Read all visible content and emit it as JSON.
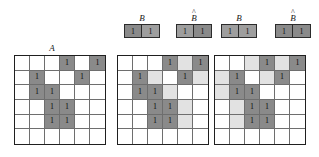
{
  "figure": {
    "caption_labels": {
      "set_a": "A",
      "b": "B",
      "b_hat": "B",
      "hat_glyph": "^"
    }
  },
  "structuring_elements": [
    {
      "id": "se-group-1",
      "name": "dilation-structuring-elements",
      "elements": [
        {
          "label": "B",
          "hat": false,
          "cells": [
            {
              "value": "1",
              "shade": "dark"
            },
            {
              "value": "1",
              "shade": "dark"
            }
          ]
        },
        {
          "label": "B",
          "hat": true,
          "cells": [
            {
              "value": "1",
              "shade": "dark"
            },
            {
              "value": "1",
              "shade": "dark"
            }
          ]
        }
      ]
    },
    {
      "id": "se-group-2",
      "name": "erosion-structuring-elements",
      "elements": [
        {
          "label": "B",
          "hat": false,
          "cells": [
            {
              "value": "1",
              "shade": "dark"
            },
            {
              "value": "1",
              "shade": "dark"
            }
          ]
        },
        {
          "label": "B",
          "hat": true,
          "cells": [
            {
              "value": "1",
              "shade": "dark"
            },
            {
              "value": "1",
              "shade": "dark"
            }
          ]
        }
      ]
    }
  ],
  "grids": [
    {
      "id": "grid-a",
      "title": "A",
      "rows": 6,
      "cols": 6,
      "cells": [
        [
          "empty",
          "empty",
          "empty",
          "dark",
          "empty",
          "dark"
        ],
        [
          "empty",
          "dark",
          "empty",
          "empty",
          "dark",
          "empty"
        ],
        [
          "empty",
          "dark",
          "dark",
          "empty",
          "empty",
          "empty"
        ],
        [
          "empty",
          "empty",
          "dark",
          "dark",
          "empty",
          "empty"
        ],
        [
          "empty",
          "empty",
          "dark",
          "dark",
          "empty",
          "empty"
        ],
        [
          "empty",
          "empty",
          "empty",
          "empty",
          "empty",
          "empty"
        ]
      ],
      "values": [
        [
          "",
          "",
          "",
          "1",
          "",
          "1"
        ],
        [
          "",
          "1",
          "",
          "",
          "1",
          ""
        ],
        [
          "",
          "1",
          "1",
          "",
          "",
          ""
        ],
        [
          "",
          "",
          "1",
          "1",
          "",
          ""
        ],
        [
          "",
          "",
          "1",
          "1",
          "",
          ""
        ],
        [
          "",
          "",
          "",
          "",
          "",
          ""
        ]
      ]
    },
    {
      "id": "grid-dilation",
      "title": "",
      "rows": 6,
      "cols": 6,
      "cells": [
        [
          "empty",
          "empty",
          "empty",
          "dark",
          "light",
          "dark"
        ],
        [
          "empty",
          "dark",
          "light",
          "empty",
          "dark",
          "light"
        ],
        [
          "empty",
          "dark",
          "dark",
          "light",
          "empty",
          "empty"
        ],
        [
          "empty",
          "empty",
          "dark",
          "dark",
          "light",
          "empty"
        ],
        [
          "empty",
          "empty",
          "dark",
          "dark",
          "light",
          "empty"
        ],
        [
          "empty",
          "empty",
          "empty",
          "empty",
          "empty",
          "empty"
        ]
      ],
      "values": [
        [
          "",
          "",
          "",
          "1",
          "",
          "1"
        ],
        [
          "",
          "1",
          "",
          "",
          "1",
          ""
        ],
        [
          "",
          "1",
          "1",
          "",
          "",
          ""
        ],
        [
          "",
          "",
          "1",
          "1",
          "",
          ""
        ],
        [
          "",
          "",
          "1",
          "1",
          "",
          ""
        ],
        [
          "",
          "",
          "",
          "",
          "",
          ""
        ]
      ]
    },
    {
      "id": "grid-erosion",
      "title": "",
      "rows": 6,
      "cols": 6,
      "cells": [
        [
          "empty",
          "empty",
          "light",
          "dark",
          "light",
          "dark"
        ],
        [
          "light",
          "dark",
          "empty",
          "light",
          "dark",
          "empty"
        ],
        [
          "light",
          "dark",
          "dark",
          "empty",
          "empty",
          "empty"
        ],
        [
          "empty",
          "light",
          "dark",
          "dark",
          "empty",
          "empty"
        ],
        [
          "empty",
          "light",
          "dark",
          "dark",
          "empty",
          "empty"
        ],
        [
          "empty",
          "empty",
          "empty",
          "empty",
          "empty",
          "empty"
        ]
      ],
      "values": [
        [
          "",
          "",
          "",
          "1",
          "",
          "1"
        ],
        [
          "",
          "1",
          "",
          "",
          "1",
          ""
        ],
        [
          "",
          "1",
          "1",
          "",
          "",
          ""
        ],
        [
          "",
          "",
          "1",
          "1",
          "",
          ""
        ],
        [
          "",
          "",
          "1",
          "1",
          "",
          ""
        ],
        [
          "",
          "",
          "",
          "",
          "",
          ""
        ]
      ]
    }
  ],
  "colors": {
    "dark_fill": "#8a8a8a",
    "light_fill": "#e2e2e2",
    "empty_fill": "#ffffff",
    "grid_border": "#1f1f1f",
    "cell_border": "#6e6e6e",
    "text": "#0d0d0d"
  }
}
